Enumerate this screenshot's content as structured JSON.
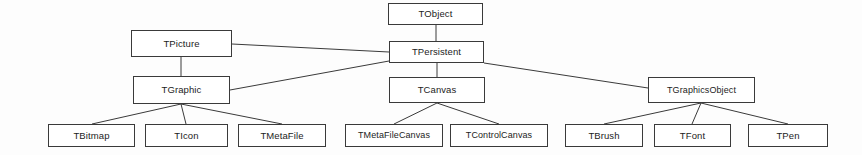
{
  "diagram": {
    "type": "class-hierarchy-tree",
    "style": {
      "background": "#fdfdfd",
      "box_fill": "#ffffff",
      "box_border": "#3a3a3a",
      "edge_color": "#3a3a3a",
      "text_color": "#1c1c1c"
    },
    "nodes": [
      {
        "id": "tobject",
        "label": "TObject",
        "x": 388,
        "y": 3,
        "w": 95,
        "h": 22,
        "level": 0
      },
      {
        "id": "tpersistent",
        "label": "TPersistent",
        "x": 389,
        "y": 41,
        "w": 95,
        "h": 22,
        "level": 1
      },
      {
        "id": "tpicture",
        "label": "TPicture",
        "x": 131,
        "y": 30,
        "w": 101,
        "h": 27,
        "level": 1
      },
      {
        "id": "tgraphic",
        "label": "TGraphic",
        "x": 133,
        "y": 76,
        "w": 97,
        "h": 28,
        "level": 2
      },
      {
        "id": "tcanvas",
        "label": "TCanvas",
        "x": 389,
        "y": 77,
        "w": 96,
        "h": 26,
        "level": 2
      },
      {
        "id": "tgraphicsobject",
        "label": "TGraphicsObject",
        "x": 648,
        "y": 77,
        "w": 107,
        "h": 26,
        "level": 2
      },
      {
        "id": "tbitmap",
        "label": "TBitmap",
        "x": 48,
        "y": 124,
        "w": 87,
        "h": 23,
        "level": 3
      },
      {
        "id": "ticon",
        "label": "TIcon",
        "x": 145,
        "y": 124,
        "w": 83,
        "h": 23,
        "level": 3
      },
      {
        "id": "tmetafile",
        "label": "TMetaFile",
        "x": 238,
        "y": 124,
        "w": 88,
        "h": 23,
        "level": 3
      },
      {
        "id": "tmetafilecanvas",
        "label": "TMetaFileCanvas",
        "x": 345,
        "y": 124,
        "w": 98,
        "h": 23,
        "level": 3
      },
      {
        "id": "tcontrolcanvas",
        "label": "TControlCanvas",
        "x": 450,
        "y": 124,
        "w": 98,
        "h": 23,
        "level": 3
      },
      {
        "id": "tbrush",
        "label": "TBrush",
        "x": 565,
        "y": 124,
        "w": 78,
        "h": 23,
        "level": 3
      },
      {
        "id": "tfont",
        "label": "TFont",
        "x": 654,
        "y": 124,
        "w": 77,
        "h": 23,
        "level": 3
      },
      {
        "id": "tpen",
        "label": "TPen",
        "x": 748,
        "y": 124,
        "w": 80,
        "h": 23,
        "level": 3
      }
    ],
    "edges": [
      {
        "id": "e-tobject-tpersistent",
        "from": "tobject",
        "to": "tpersistent",
        "points": "436,25 436,41"
      },
      {
        "id": "e-tpersistent-tpicture",
        "from": "tpersistent",
        "to": "tpicture",
        "points": "232,44 389,52"
      },
      {
        "id": "e-tpersistent-tgraphic",
        "from": "tpersistent",
        "to": "tgraphic",
        "points": "230,90 389,61"
      },
      {
        "id": "e-tpersistent-tcanvas",
        "from": "tpersistent",
        "to": "tcanvas",
        "points": "437,63 437,77"
      },
      {
        "id": "e-tpersistent-tgraphicsobject",
        "from": "tpersistent",
        "to": "tgraphicsobject",
        "points": "484,63 648,88"
      },
      {
        "id": "e-tpicture-tgraphic",
        "from": "tpicture",
        "to": "tgraphic",
        "points": "181,57 181,76"
      },
      {
        "id": "e-tgraphic-tbitmap",
        "from": "tgraphic",
        "to": "tbitmap",
        "points": "181,104 92,124"
      },
      {
        "id": "e-tgraphic-ticon",
        "from": "tgraphic",
        "to": "ticon",
        "points": "181,104 186,124"
      },
      {
        "id": "e-tgraphic-tmetafile",
        "from": "tgraphic",
        "to": "tmetafile",
        "points": "181,104 282,124"
      },
      {
        "id": "e-tcanvas-tmetafilecanvas",
        "from": "tcanvas",
        "to": "tmetafilecanvas",
        "points": "437,103 394,124"
      },
      {
        "id": "e-tcanvas-tcontrolcanvas",
        "from": "tcanvas",
        "to": "tcontrolcanvas",
        "points": "437,103 499,124"
      },
      {
        "id": "e-tgraphicsobject-tbrush",
        "from": "tgraphicsobject",
        "to": "tbrush",
        "points": "701,103 604,124"
      },
      {
        "id": "e-tgraphicsobject-tfont",
        "from": "tgraphicsobject",
        "to": "tfont",
        "points": "701,103 692,124"
      },
      {
        "id": "e-tgraphicsobject-tpen",
        "from": "tgraphicsobject",
        "to": "tpen",
        "points": "701,103 788,124"
      }
    ]
  }
}
